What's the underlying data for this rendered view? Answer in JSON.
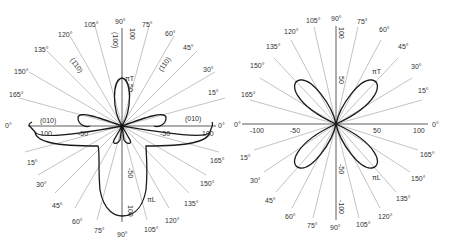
{
  "diagrams": [
    {
      "id": "left",
      "center": [
        122,
        126
      ],
      "scale_px_per_unit": 1.0,
      "angle_labels_top": [
        "0°",
        "15°",
        "30°",
        "45°",
        "60°",
        "75°",
        "90°",
        "105°",
        "120°",
        "135°",
        "150°",
        "165°",
        "0°"
      ],
      "angle_labels_bottom": [
        "15°",
        "30°",
        "45°",
        "60°",
        "75°",
        "90°",
        "105°",
        "120°",
        "135°",
        "150°",
        "165°"
      ],
      "axis_ticks_horizontal": [
        "-100",
        "-50",
        "-50",
        "100"
      ],
      "axis_ticks_vertical": [
        "100",
        "50",
        "-50",
        "100"
      ],
      "direction_labels": {
        "left": "(010)",
        "right": "(010)",
        "top": "(100)",
        "upper_left": "(1̄10)",
        "upper_right": "(110)"
      },
      "curve_labels": {
        "transverse": "πT",
        "longitudinal": "πL"
      }
    },
    {
      "id": "right",
      "center": [
        336,
        124
      ],
      "scale_px_per_unit": 0.8,
      "angle_labels_top": [
        "0°",
        "15°",
        "30°",
        "45°",
        "60°",
        "75°",
        "90°",
        "105°",
        "120°",
        "135°",
        "150°",
        "165°",
        "0°"
      ],
      "angle_labels_bottom": [
        "15°",
        "30°",
        "45°",
        "60°",
        "75°",
        "90°",
        "105°",
        "120°",
        "135°",
        "150°",
        "165°"
      ],
      "axis_ticks_horizontal": [
        "-100",
        "-50",
        "50",
        "100"
      ],
      "axis_ticks_vertical": [
        "100",
        "50",
        "-50",
        "-100"
      ],
      "curve_labels": {
        "transverse": "πT",
        "longitudinal": "πL"
      }
    }
  ]
}
